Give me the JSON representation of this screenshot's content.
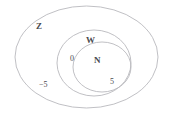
{
  "diagram": {
    "type": "euler-nested-sets",
    "background_color": "#ffffff",
    "stroke_color": "#b9b9bd",
    "text_color": "#4a4a4e",
    "sets": [
      {
        "id": "z",
        "label": "Z",
        "name": "integers",
        "level": 0,
        "cx": 86.5,
        "cy": 57,
        "rx": 71.5,
        "ry": 51
      },
      {
        "id": "w",
        "label": "W",
        "name": "whole-numbers",
        "level": 1,
        "cx": 94,
        "cy": 63,
        "rx": 37,
        "ry": 33
      },
      {
        "id": "n",
        "label": "N",
        "name": "natural-numbers",
        "level": 2,
        "cx": 102,
        "cy": 67,
        "rx": 29,
        "ry": 25
      }
    ],
    "elements": [
      {
        "id": "neg5",
        "label": "−5",
        "region": "z-only"
      },
      {
        "id": "zero",
        "label": "0",
        "region": "w-only"
      },
      {
        "id": "five",
        "label": "5",
        "region": "n"
      }
    ]
  }
}
